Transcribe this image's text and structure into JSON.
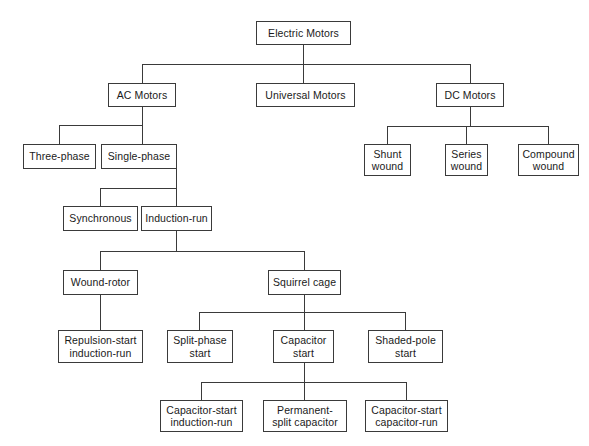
{
  "diagram": {
    "type": "tree",
    "faint_header_text": "",
    "colors": {
      "background": "#ffffff",
      "box_border": "#3a3a3a",
      "line": "#3a3a3a",
      "text": "#1a1a1a"
    },
    "nodes": [
      {
        "id": "electric-motors",
        "label": "Electric Motors",
        "level": 0
      },
      {
        "id": "ac-motors",
        "label": "AC Motors",
        "level": 1
      },
      {
        "id": "universal-motors",
        "label": "Universal Motors",
        "level": 1
      },
      {
        "id": "dc-motors",
        "label": "DC Motors",
        "level": 1
      },
      {
        "id": "three-phase",
        "label": "Three-phase",
        "level": 2
      },
      {
        "id": "single-phase",
        "label": "Single-phase",
        "level": 2
      },
      {
        "id": "shunt-wound",
        "label": "Shunt\nwound",
        "level": 2
      },
      {
        "id": "series-wound",
        "label": "Series\nwound",
        "level": 2
      },
      {
        "id": "compound-wound",
        "label": "Compound\nwound",
        "level": 2
      },
      {
        "id": "synchronous",
        "label": "Synchronous",
        "level": 3
      },
      {
        "id": "induction-run",
        "label": "Induction-run",
        "level": 3
      },
      {
        "id": "wound-rotor",
        "label": "Wound-rotor",
        "level": 4
      },
      {
        "id": "squirrel-cage",
        "label": "Squirrel cage",
        "level": 4
      },
      {
        "id": "repulsion-start",
        "label": "Repulsion-start\ninduction-run",
        "level": 5
      },
      {
        "id": "split-phase-start",
        "label": "Split-phase\nstart",
        "level": 5
      },
      {
        "id": "capacitor-start",
        "label": "Capacitor\nstart",
        "level": 5
      },
      {
        "id": "shaded-pole-start",
        "label": "Shaded-pole\nstart",
        "level": 5
      },
      {
        "id": "capacitor-start-induction",
        "label": "Capacitor-start\ninduction-run",
        "level": 6
      },
      {
        "id": "permanent-split-capacitor",
        "label": "Permanent-\nsplit capacitor",
        "level": 6
      },
      {
        "id": "capacitor-start-capacitor",
        "label": "Capacitor-start\ncapacitor-run",
        "level": 6
      }
    ],
    "edges": [
      {
        "from": "electric-motors",
        "to": "ac-motors"
      },
      {
        "from": "electric-motors",
        "to": "universal-motors"
      },
      {
        "from": "electric-motors",
        "to": "dc-motors"
      },
      {
        "from": "ac-motors",
        "to": "three-phase"
      },
      {
        "from": "ac-motors",
        "to": "single-phase"
      },
      {
        "from": "dc-motors",
        "to": "shunt-wound"
      },
      {
        "from": "dc-motors",
        "to": "series-wound"
      },
      {
        "from": "dc-motors",
        "to": "compound-wound"
      },
      {
        "from": "single-phase",
        "to": "synchronous"
      },
      {
        "from": "single-phase",
        "to": "induction-run"
      },
      {
        "from": "induction-run",
        "to": "wound-rotor"
      },
      {
        "from": "induction-run",
        "to": "squirrel-cage"
      },
      {
        "from": "wound-rotor",
        "to": "repulsion-start"
      },
      {
        "from": "squirrel-cage",
        "to": "split-phase-start"
      },
      {
        "from": "squirrel-cage",
        "to": "capacitor-start"
      },
      {
        "from": "squirrel-cage",
        "to": "shaded-pole-start"
      },
      {
        "from": "capacitor-start",
        "to": "capacitor-start-induction"
      },
      {
        "from": "capacitor-start",
        "to": "permanent-split-capacitor"
      },
      {
        "from": "capacitor-start",
        "to": "capacitor-start-capacitor"
      }
    ]
  }
}
